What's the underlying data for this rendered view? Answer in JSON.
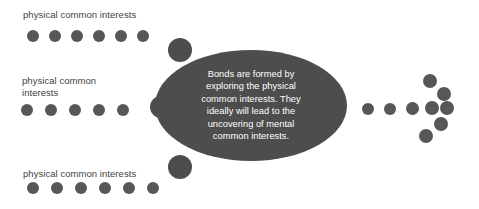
{
  "canvas": {
    "width": 479,
    "height": 209,
    "background": "#ffffff"
  },
  "colors": {
    "dot": "#575757",
    "ellipse_fill": "#4d4d4d",
    "ellipse_text": "#ffffff",
    "label_text": "#3f3f3f"
  },
  "center": {
    "shape": "ellipse",
    "text": "Bonds are formed by\nexploring the physical\ncommon interests. They\nideally will lead to the\nuncovering of mental\ncommon interests.",
    "lines": [
      "Bonds are formed by",
      "exploring the physical",
      "common interests. They",
      "ideally will lead to the",
      "uncovering of mental",
      "common interests."
    ],
    "box": {
      "x": 155,
      "y": 50,
      "width": 192,
      "height": 111
    }
  },
  "groups": [
    {
      "id": "top-left",
      "label": "physical common interests",
      "label_pos": {
        "x": 23,
        "y": 9
      },
      "dot_count": 6,
      "dot_size": 12,
      "dot_row_y": 30,
      "dot_start_x": 27,
      "dot_spacing": 22
    },
    {
      "id": "middle-left",
      "label": "physical common\ninterests",
      "label_pos": {
        "x": 22,
        "y": 75
      },
      "dot_count": 5,
      "dot_size": 12,
      "dot_row_y": 104,
      "dot_start_x": 21,
      "dot_spacing": 24
    },
    {
      "id": "bottom-left",
      "label": "physical common interests",
      "label_pos": {
        "x": 23,
        "y": 168
      },
      "dot_count": 6,
      "dot_size": 12,
      "dot_row_y": 182,
      "dot_start_x": 27,
      "dot_spacing": 24
    }
  ],
  "bumps": [
    {
      "id": "bump-top",
      "x": 168,
      "y": 38,
      "size": 24
    },
    {
      "id": "bump-middle",
      "x": 150,
      "y": 96,
      "size": 22
    },
    {
      "id": "bump-bottom",
      "x": 168,
      "y": 155,
      "size": 24
    }
  ],
  "arrow": {
    "id": "right-arrow",
    "description": "rightward arrow composed of dots",
    "shaft": [
      {
        "x": 362,
        "y": 103,
        "size": 12
      },
      {
        "x": 384,
        "y": 103,
        "size": 12
      },
      {
        "x": 406,
        "y": 102,
        "size": 13
      },
      {
        "x": 425,
        "y": 101,
        "size": 14
      }
    ],
    "head": [
      {
        "x": 423,
        "y": 74,
        "size": 14
      },
      {
        "x": 437,
        "y": 87,
        "size": 14
      },
      {
        "x": 440,
        "y": 101,
        "size": 14
      },
      {
        "x": 434,
        "y": 117,
        "size": 14
      },
      {
        "x": 419,
        "y": 129,
        "size": 14
      }
    ]
  }
}
